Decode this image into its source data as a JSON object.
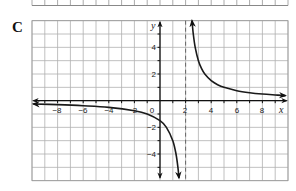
{
  "figure": {
    "panel_label": "C"
  },
  "chart_data": {
    "type": "line",
    "title": "",
    "function": "y = 3/(x - 2)",
    "xlabel": "x",
    "ylabel": "y",
    "xlim": [
      -10,
      10
    ],
    "ylim": [
      -6,
      6
    ],
    "grid": true,
    "grid_step": 1,
    "asymptotes": {
      "vertical": [
        2
      ],
      "horizontal": [
        0
      ]
    },
    "x_ticks": [
      -8,
      -6,
      -4,
      -2,
      0,
      2,
      4,
      6,
      8
    ],
    "x_tick_labels": [
      "−8",
      "−6",
      "−4",
      "2",
      "0",
      "2",
      "4",
      "6",
      "8"
    ],
    "y_ticks": [
      4,
      2,
      -2,
      -4
    ],
    "y_tick_labels": [
      "4",
      "2",
      "−2",
      "−4"
    ],
    "series": [
      {
        "name": "right-branch",
        "points": [
          [
            2.5,
            6
          ],
          [
            2.6,
            5
          ],
          [
            2.75,
            4
          ],
          [
            3,
            3
          ],
          [
            3.25,
            2.4
          ],
          [
            3.5,
            2
          ],
          [
            4,
            1.5
          ],
          [
            4.5,
            1.2
          ],
          [
            5,
            1
          ],
          [
            6,
            0.75
          ],
          [
            7,
            0.6
          ],
          [
            8,
            0.5
          ],
          [
            9,
            0.43
          ],
          [
            9.8,
            0.38
          ]
        ]
      },
      {
        "name": "left-branch",
        "points": [
          [
            -9.9,
            -0.25
          ],
          [
            -8,
            -0.3
          ],
          [
            -6,
            -0.38
          ],
          [
            -4,
            -0.5
          ],
          [
            -2,
            -0.75
          ],
          [
            -1,
            -1
          ],
          [
            0,
            -1.5
          ],
          [
            0.5,
            -2
          ],
          [
            1,
            -3
          ],
          [
            1.25,
            -4
          ],
          [
            1.4,
            -5
          ],
          [
            1.48,
            -5.8
          ]
        ]
      }
    ]
  }
}
